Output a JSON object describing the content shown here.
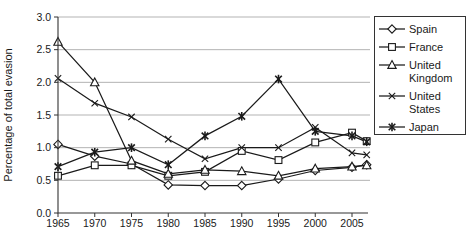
{
  "figure": {
    "background": "#ffffff",
    "axis_color": "#333333",
    "grid_color": "#b3b3b3",
    "series_color": "#1a1a1a"
  },
  "chart_data": {
    "type": "line",
    "title": "",
    "ylabel": "Percentage of total evasion",
    "xlabel": "",
    "ylim": [
      0.0,
      3.0
    ],
    "xlim": [
      1965,
      2007.5
    ],
    "grid": "horizontal gridlines on",
    "legend_position": "right, boxed",
    "x": [
      1965,
      1970,
      1975,
      1980,
      1985,
      1990,
      1995,
      2000,
      2005,
      2007
    ],
    "x_tick_labels": [
      "1965",
      "1970",
      "1975",
      "1980",
      "1985",
      "1990",
      "1995",
      "2000",
      "2005"
    ],
    "y_ticks": [
      0.0,
      0.5,
      1.0,
      1.5,
      2.0,
      2.5,
      3.0
    ],
    "y_tick_labels": [
      "0.0",
      "0.5",
      "1.0",
      "1.5",
      "2.0",
      "2.5",
      "3.0"
    ],
    "series": [
      {
        "name": "Spain",
        "marker": "diamond",
        "values": [
          1.05,
          0.87,
          0.75,
          0.43,
          0.42,
          0.42,
          0.52,
          0.65,
          0.7,
          0.74
        ]
      },
      {
        "name": "France",
        "marker": "square",
        "values": [
          0.57,
          0.73,
          0.73,
          0.57,
          0.63,
          0.95,
          0.81,
          1.08,
          1.23,
          1.1
        ]
      },
      {
        "name": "United Kingdom",
        "marker": "triangle",
        "values": [
          2.62,
          2.0,
          0.8,
          0.6,
          0.66,
          0.64,
          0.57,
          0.68,
          0.71,
          0.73
        ]
      },
      {
        "name": "United States",
        "marker": "x",
        "values": [
          2.06,
          1.68,
          1.47,
          1.13,
          0.83,
          1.0,
          1.0,
          1.31,
          0.92,
          0.89
        ]
      },
      {
        "name": "Japan",
        "marker": "asterisk",
        "values": [
          0.71,
          0.93,
          1.0,
          0.74,
          1.18,
          1.48,
          2.05,
          1.25,
          1.18,
          1.09
        ]
      }
    ]
  }
}
